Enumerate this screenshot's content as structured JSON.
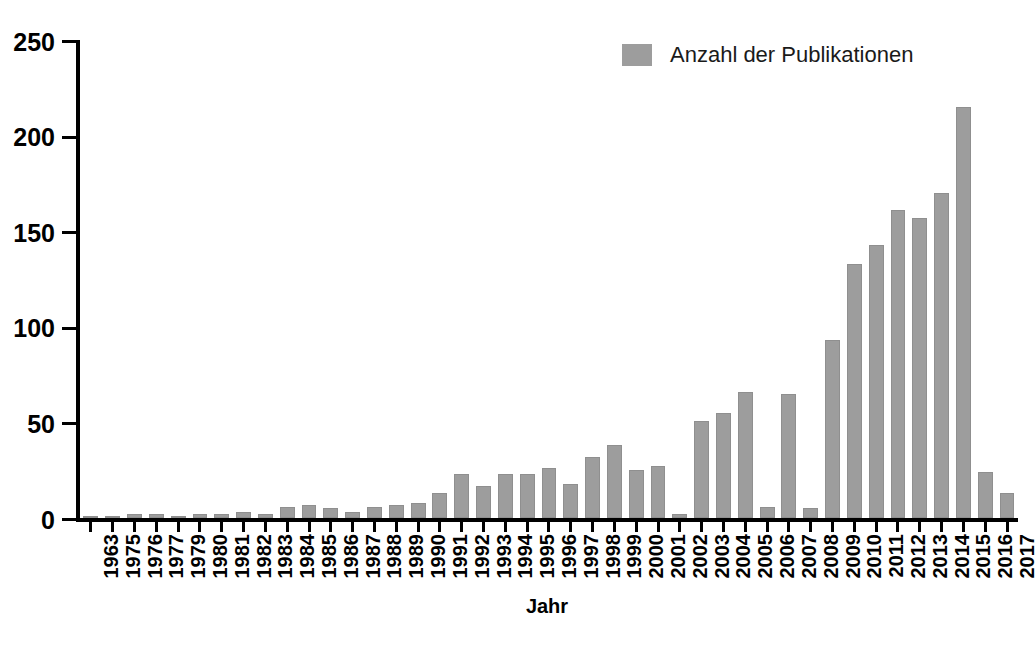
{
  "chart_data": {
    "type": "bar",
    "title": "",
    "xlabel": "Jahr",
    "ylabel": "",
    "ylim": [
      0,
      250
    ],
    "yticks": [
      0,
      50,
      100,
      150,
      200,
      250
    ],
    "grid": false,
    "legend_position": "top-right",
    "series": [
      {
        "name": "Anzahl der Publikationen",
        "color": "#9d9d9d",
        "values": [
          1,
          1,
          2,
          2,
          1,
          2,
          2,
          3,
          2,
          6,
          7,
          5,
          3,
          6,
          7,
          8,
          13,
          23,
          17,
          23,
          23,
          26,
          18,
          32,
          38,
          25,
          27,
          2,
          51,
          55,
          66,
          6,
          65,
          5,
          93,
          133,
          143,
          161,
          157,
          170,
          215,
          24,
          13
        ]
      }
    ],
    "categories": [
      "1963",
      "1975",
      "1976",
      "1977",
      "1979",
      "1980",
      "1981",
      "1982",
      "1983",
      "1984",
      "1985",
      "1986",
      "1987",
      "1988",
      "1989",
      "1990",
      "1991",
      "1992",
      "1993",
      "1994",
      "1995",
      "1996",
      "1997",
      "1998",
      "1999",
      "2000",
      "2001",
      "2002",
      "2003",
      "2004",
      "2005",
      "2006",
      "2007",
      "2008",
      "2009",
      "2010",
      "2011",
      "2012",
      "2013",
      "2014",
      "2015",
      "2016",
      "2017"
    ]
  },
  "legend": {
    "entries": [
      {
        "label": "Anzahl der Publikationen",
        "color": "#9d9d9d"
      }
    ]
  },
  "axes": {
    "x_title": "Jahr",
    "y_tick_labels": [
      "250",
      "200",
      "150",
      "100",
      "50",
      "0"
    ]
  }
}
